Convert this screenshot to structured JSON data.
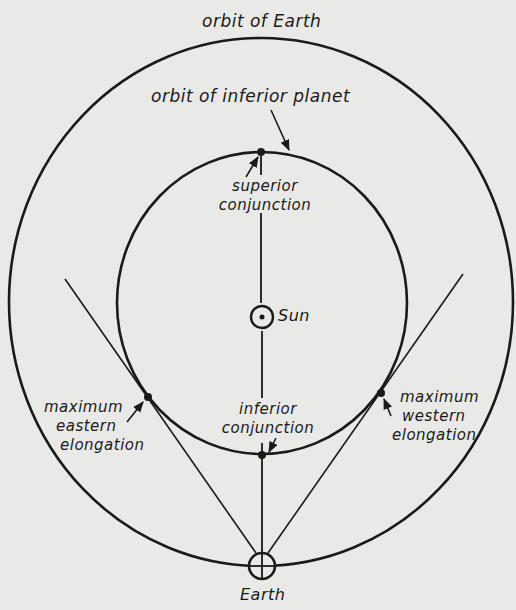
{
  "diagram": {
    "colors": {
      "background": "#e9e9e7",
      "ink": "#1a1a1a"
    },
    "labels": {
      "orbit_of_earth": "orbit of Earth",
      "orbit_of_inferior_planet": "orbit of inferior planet",
      "superior_conjunction_1": "superior",
      "superior_conjunction_2": "conjunction",
      "sun": "Sun",
      "inferior_conjunction_1": "inferior",
      "inferior_conjunction_2": "conjunction",
      "max_eastern_1": "maximum",
      "max_eastern_2": "eastern",
      "max_eastern_3": "elongation",
      "max_western_1": "maximum",
      "max_western_2": "western",
      "max_western_3": "elongation",
      "earth": "Earth"
    },
    "elements": [
      {
        "name": "orbit-of-earth",
        "shape": "ellipse",
        "cx": 261,
        "cy": 302,
        "rx": 252,
        "ry": 264
      },
      {
        "name": "orbit-of-inferior-planet",
        "shape": "ellipse",
        "cx": 262,
        "cy": 303,
        "rx": 145,
        "ry": 151
      },
      {
        "name": "sun-symbol",
        "shape": "circle-dot",
        "x": 262,
        "y": 317
      },
      {
        "name": "earth-symbol",
        "shape": "circle-cross",
        "x": 262,
        "y": 566
      },
      {
        "name": "superior-conjunction-point",
        "x": 261,
        "y": 152
      },
      {
        "name": "inferior-conjunction-point",
        "x": 262,
        "y": 455
      },
      {
        "name": "max-eastern-elongation-point",
        "x": 148,
        "y": 397
      },
      {
        "name": "max-western-elongation-point",
        "x": 381,
        "y": 393
      }
    ]
  }
}
